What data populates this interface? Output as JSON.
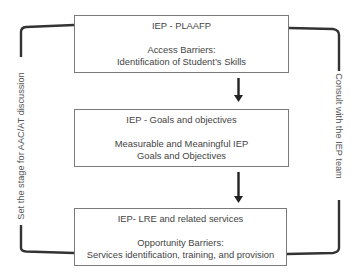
{
  "diagram": {
    "boxes": [
      {
        "title": "IEP - PLAAFP",
        "body_lines": [
          "Access Barriers:",
          "Identification of Student’s Skills"
        ]
      },
      {
        "title": "IEP - Goals and objectives",
        "body_lines": [
          "Measurable and Meaningful IEP",
          "Goals and Objectives"
        ]
      },
      {
        "title": "IEP- LRE and related services",
        "body_lines": [
          "Opportunity Barriers:",
          "Services identification, training, and provision"
        ]
      }
    ],
    "arrows": [
      {
        "from": "IEP - PLAAFP",
        "to": "IEP - Goals and objectives",
        "icon": "down-arrow-icon"
      },
      {
        "from": "IEP - Goals and objectives",
        "to": "IEP- LRE and related services",
        "icon": "down-arrow-icon"
      }
    ],
    "left_bracket_label": "Set the stage for AAC/AT discussion",
    "right_bracket_label": "Consult with the IEP team",
    "colors": {
      "box_border": "#7a7a7a",
      "connector": "#333333",
      "text": "#444444"
    }
  }
}
